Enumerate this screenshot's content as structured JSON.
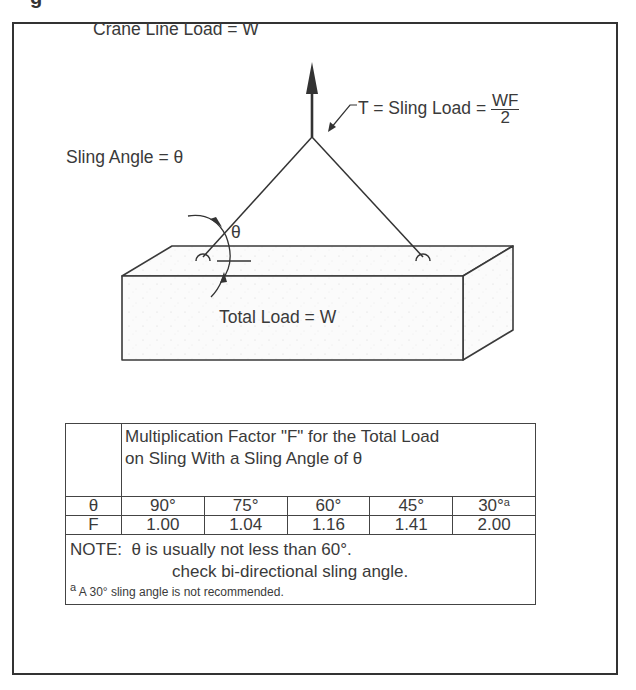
{
  "header": {
    "cutoff_glyph": "g"
  },
  "diagram": {
    "crane_line_label": "Crane Line Load = W",
    "sling_angle_label": "Sling Angle = θ",
    "sling_load_label": "T = Sling Load =",
    "sling_load_numerator": "WF",
    "sling_load_denominator": "2",
    "theta_symbol": "θ",
    "total_load_label": "Total Load = W"
  },
  "table": {
    "header": "Multiplication Factor \"F\" for the Total Load on Sling With a Sling Angle of θ",
    "header_line1": "Multiplication Factor \"F\" for the Total Load",
    "header_line2": "on Sling With a Sling Angle of θ",
    "rows": [
      {
        "label": "θ",
        "values": [
          "90°",
          "75°",
          "60°",
          "45°",
          "30°"
        ],
        "last_superscript": "a"
      },
      {
        "label": "F",
        "values": [
          "1.00",
          "1.04",
          "1.16",
          "1.41",
          "2.00"
        ]
      }
    ],
    "note_line1": "NOTE:  θ is usually not less than 60°.",
    "note_line2": "check bi-directional sling angle.",
    "footnote_marker": "a",
    "footnote": "A 30° sling angle is not recommended."
  }
}
